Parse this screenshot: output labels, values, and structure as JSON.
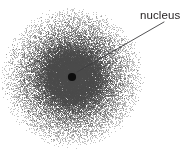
{
  "figure": {
    "width": 194,
    "height": 150,
    "background_color": "#ffffff"
  },
  "annotations": [
    {
      "id": "nucleus-label",
      "text": "nucleus",
      "x": 140,
      "y": 10,
      "color": "#231f20",
      "font_size": 11.5
    }
  ],
  "leader_line": {
    "name": "nucleus-leader-line",
    "x1": 164,
    "y1": 22,
    "x2": 77,
    "y2": 72,
    "color": "#3f3f42",
    "width": 0.9
  },
  "nucleus": {
    "name": "nucleus-dot",
    "cx": 72,
    "cy": 77,
    "r": 4.1,
    "color": "#0d0d0d"
  },
  "electron_cloud": {
    "name": "electron-cloud",
    "center_x": 72,
    "center_y": 77,
    "core_radius": 23,
    "outer_radius": 72,
    "dot_color": "#4a4a4a",
    "core_fill": "#8e8e8e",
    "point_count": 26000,
    "seed": 20240117
  },
  "chart_data": {
    "type": "scatter",
    "subtitle": "",
    "xlabel": "",
    "ylabel": "",
    "xlim": [
      0,
      194
    ],
    "ylim": [
      0,
      150
    ],
    "grid": false,
    "legend": null,
    "annotations": [
      "nucleus"
    ],
    "series": [
      {
        "name": "electron probability density",
        "render": "stipple",
        "center": [
          72,
          77
        ],
        "radial_profile_radius": [
          0,
          8,
          16,
          23,
          30,
          40,
          52,
          64,
          72
        ],
        "radial_profile_density": [
          1.0,
          0.98,
          0.93,
          0.82,
          0.52,
          0.3,
          0.16,
          0.06,
          0.0
        ],
        "point_count": 26000,
        "color": "#4a4a4a"
      },
      {
        "name": "nucleus",
        "render": "point",
        "x": [
          72
        ],
        "y": [
          77
        ],
        "size": 8.2,
        "color": "#0d0d0d"
      }
    ]
  }
}
